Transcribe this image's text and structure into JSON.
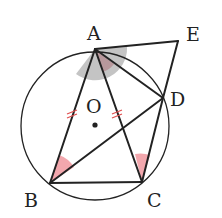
{
  "diagram": {
    "labels": {
      "A": "A",
      "B": "B",
      "C": "C",
      "D": "D",
      "E": "E",
      "O": "O"
    },
    "points": {
      "A": [
        95,
        49
      ],
      "B": [
        50,
        183
      ],
      "C": [
        142,
        182
      ],
      "D": [
        163,
        98
      ],
      "E": [
        178,
        41
      ],
      "O": [
        95,
        126
      ]
    },
    "circle": {
      "cx": 95,
      "cy": 126,
      "r": 74
    },
    "colors": {
      "line": "#222222",
      "pink": "#f2a7ad",
      "gray": "#bdbdbd",
      "mauve": "#b89a9e",
      "tick": "#e05050"
    }
  }
}
